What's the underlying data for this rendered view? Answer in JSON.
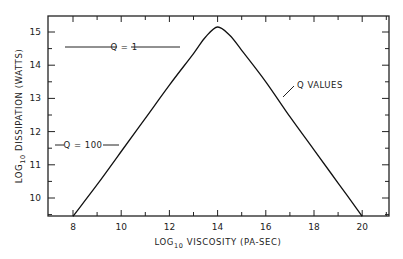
{
  "chart_data": {
    "type": "line",
    "title": "",
    "xlabel": "LOG10 VISCOSITY (PA-SEC)",
    "xlabel_parts": {
      "pre": "LOG",
      "sub": "10",
      "post": " VISCOSITY (PA-SEC)"
    },
    "ylabel": "LOG10 DISSIPATION (WATTS)",
    "ylabel_parts": {
      "pre": "LOG",
      "sub": "10",
      "post": " DISSIPATION (WATTS)"
    },
    "xlim": [
      7,
      21
    ],
    "ylim": [
      9.45,
      15.5
    ],
    "x_ticks": [
      8,
      10,
      12,
      14,
      16,
      18,
      20
    ],
    "x_tick_labels": [
      "8",
      "10",
      "12",
      "14",
      "16",
      "18",
      "20"
    ],
    "y_ticks": [
      10,
      11,
      12,
      13,
      14,
      15
    ],
    "y_tick_labels": [
      "10",
      "11",
      "12",
      "13",
      "14",
      "15"
    ],
    "grid": false,
    "legend": null,
    "series": [
      {
        "name": "Q values",
        "x": [
          8,
          9,
          10,
          11,
          12,
          13,
          13.5,
          14,
          14.5,
          15,
          16,
          17,
          18,
          19,
          20
        ],
        "y": [
          9.45,
          10.4,
          11.4,
          12.4,
          13.4,
          14.35,
          14.85,
          15.15,
          14.9,
          14.45,
          13.5,
          12.45,
          11.45,
          10.45,
          9.45
        ]
      }
    ],
    "annotations": [
      {
        "text": "Q = 1",
        "x": 10.5,
        "y": 14.55,
        "type": "horizontal-reference-line"
      },
      {
        "text": "Q = 100",
        "x": 9.0,
        "y": 11.6,
        "type": "horizontal-reference-line"
      },
      {
        "text": "Q VALUES",
        "x": 17.6,
        "y": 13.5,
        "type": "pointer-label"
      }
    ]
  }
}
